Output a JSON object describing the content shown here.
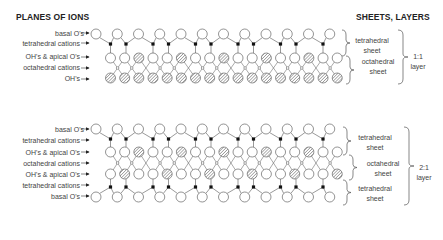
{
  "headers": {
    "left": "PLANES OF IONS",
    "right": "SHEETS, LAYERS"
  },
  "diagram_1_1": {
    "planes": [
      {
        "label": "basal O's"
      },
      {
        "label": "tetrahedral cations"
      },
      {
        "label": "OH's & apical O's"
      },
      {
        "label": "octahedral cations"
      },
      {
        "label": "OH's"
      }
    ],
    "sheets": [
      {
        "label_line1": "tetrahedral",
        "label_line2": "sheet"
      },
      {
        "label_line1": "octahedral",
        "label_line2": "sheet"
      }
    ],
    "layer": {
      "line1": "1:1",
      "line2": "layer"
    }
  },
  "diagram_2_1": {
    "planes": [
      {
        "label": "basal O's"
      },
      {
        "label": "tetrahedral cations"
      },
      {
        "label": "OH's & apical O's"
      },
      {
        "label": "octahedral cations"
      },
      {
        "label": "OH's & apical O's"
      },
      {
        "label": "tetrahedral cations"
      },
      {
        "label": "basal O's"
      }
    ],
    "sheets": [
      {
        "label_line1": "tetrahedral",
        "label_line2": "sheet"
      },
      {
        "label_line1": "octahedral",
        "label_line2": "sheet"
      },
      {
        "label_line1": "tetrahedral",
        "label_line2": "sheet"
      }
    ],
    "layer": {
      "line1": "2:1",
      "line2": "layer"
    }
  },
  "legend_symbols": {
    "oxygen": "open-circle",
    "hydroxyl": "hatched-circle",
    "cation": "small-black-square"
  },
  "colors": {
    "line": "#555555",
    "circle_stroke": "#666666",
    "cation": "#111111",
    "hatch": "#777777"
  }
}
